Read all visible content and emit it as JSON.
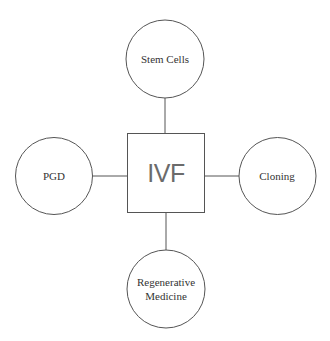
{
  "diagram": {
    "center": {
      "label": "IVF"
    },
    "nodes": [
      {
        "id": "top",
        "label_lines": [
          "Stem Cells"
        ]
      },
      {
        "id": "left",
        "label_lines": [
          "PGD"
        ]
      },
      {
        "id": "right",
        "label_lines": [
          "Cloning"
        ]
      },
      {
        "id": "bottom",
        "label_lines": [
          "Regenerative",
          "Medicine"
        ]
      }
    ],
    "colors": {
      "stroke": "#555555",
      "center_text": "#6b6b6b",
      "node_text": "#333333",
      "background": "#ffffff"
    }
  }
}
